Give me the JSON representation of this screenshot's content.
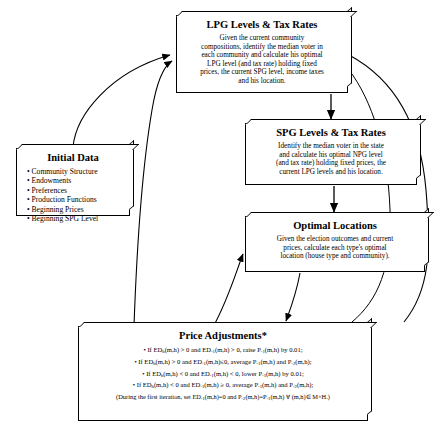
{
  "diagram": {
    "type": "flowchart",
    "nodes": [
      {
        "id": "lpg",
        "title": "LPG Levels & Tax Rates",
        "lines": [
          "Given the current community",
          "compositions, identify the median voter in",
          "each community and calculate his optimal",
          "LPG level  (and tax rate) holding fixed",
          "prices, the current SPG level, income taxes",
          "and his location."
        ]
      },
      {
        "id": "spg",
        "title": "SPG Levels & Tax Rates",
        "lines": [
          "Identify the median voter in the state",
          "and calculate his optimal NPG level",
          "(and tax rate) holding fixed prices, the",
          "current LPG levels and his location."
        ]
      },
      {
        "id": "initial",
        "title": "Initial Data",
        "bullets": [
          "• Community Structure",
          "• Endowments",
          "• Preferences",
          "• Production Functions",
          "• Beginning Prices",
          "• Beginning SPG Level"
        ]
      },
      {
        "id": "optimal",
        "title": "Optimal Locations",
        "lines": [
          "Given the election outcomes and current",
          "prices, calculate each type's optimal",
          "location (house type and community)."
        ]
      },
      {
        "id": "price",
        "title": "Price Adjustments*",
        "formulas": [
          "• If EDh(m,h) > 0 and ED-1(m,h) > 0, raise P-1(m,h) by 0.01;",
          "• If EDh(m,h) > 0 and ED-1(m,h)≤0, average P-1(m,h) and P-2(m,h);",
          "• If EDh(m,h) < 0 and ED-1(m,h) < 0, lower P-1(m,h) by 0.01;",
          "• If EDh(m,h) < 0 and ED-1(m,h) ≥ 0, average P-1(m,h) and P-2(m,h);"
        ],
        "note": "(During the first iteration, set ED-1(m,h)=0 and P-2(m,h)=P-1(m,h) ∀ (m,h)∈ M×H.)"
      }
    ],
    "edges": [
      {
        "from": "lpg",
        "to": "spg",
        "kind": "arrow-down"
      },
      {
        "from": "spg",
        "to": "optimal",
        "kind": "arrow-down"
      },
      {
        "from": "optimal",
        "to": "price",
        "kind": "curve"
      },
      {
        "from": "price",
        "to": "lpg",
        "kind": "curve"
      },
      {
        "from": "initial",
        "to": "lpg",
        "kind": "curve"
      },
      {
        "from": "price",
        "to": "optimal",
        "kind": "curve"
      }
    ]
  },
  "colors": {
    "stroke": "#000000",
    "background": "#ffffff"
  }
}
